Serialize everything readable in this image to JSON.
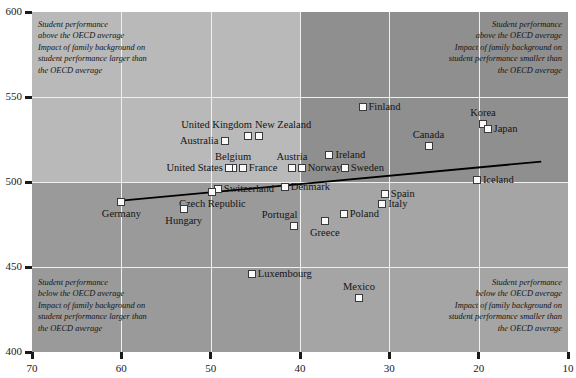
{
  "chart_data": {
    "type": "scatter",
    "title": "",
    "xlabel": "",
    "ylabel": "",
    "xlim": [
      70,
      10
    ],
    "ylim": [
      400,
      600
    ],
    "x_axis_reversed": true,
    "x_ticks": [
      70,
      60,
      50,
      40,
      30,
      20,
      10
    ],
    "y_ticks": [
      400,
      450,
      500,
      550,
      600
    ],
    "grid": true,
    "legend": "none",
    "quadrant_split": {
      "x": 40,
      "y": 500
    },
    "trendline": {
      "x_start": 60,
      "y_start": 489,
      "x_end": 13,
      "y_end": 512
    },
    "points": [
      {
        "label": "Finland",
        "x": 33.0,
        "y": 544,
        "label_pos": "right"
      },
      {
        "label": "Canada",
        "x": 25.6,
        "y": 521,
        "label_pos": "above"
      },
      {
        "label": "Ireland",
        "x": 36.7,
        "y": 516,
        "label_pos": "right"
      },
      {
        "label": "Korea",
        "x": 19.5,
        "y": 534,
        "label_pos": "above"
      },
      {
        "label": "Japan",
        "x": 19.0,
        "y": 531,
        "label_pos": "right"
      },
      {
        "label": "Sweden",
        "x": 35.0,
        "y": 508,
        "label_pos": "right"
      },
      {
        "label": "United Kingdom",
        "x": 45.8,
        "y": 527,
        "label_pos": "above-left"
      },
      {
        "label": "New Zealand",
        "x": 44.6,
        "y": 527,
        "label_pos": "above-right"
      },
      {
        "label": "Australia",
        "x": 48.4,
        "y": 524,
        "label_pos": "left"
      },
      {
        "label": "Belgium",
        "x": 47.5,
        "y": 508,
        "label_pos": "above"
      },
      {
        "label": "France",
        "x": 46.4,
        "y": 508,
        "label_pos": "right"
      },
      {
        "label": "United States",
        "x": 48.0,
        "y": 508,
        "label_pos": "left"
      },
      {
        "label": "Austria",
        "x": 40.9,
        "y": 508,
        "label_pos": "above"
      },
      {
        "label": "Norway",
        "x": 39.8,
        "y": 508,
        "label_pos": "right"
      },
      {
        "label": "Iceland",
        "x": 20.2,
        "y": 501,
        "label_pos": "right"
      },
      {
        "label": "Denmark",
        "x": 41.7,
        "y": 497,
        "label_pos": "right"
      },
      {
        "label": "Switzerland",
        "x": 49.2,
        "y": 496,
        "label_pos": "right"
      },
      {
        "label": "Czech Republic",
        "x": 49.8,
        "y": 494,
        "label_pos": "below"
      },
      {
        "label": "Germany",
        "x": 60.0,
        "y": 488,
        "label_pos": "below"
      },
      {
        "label": "Hungary",
        "x": 53.0,
        "y": 484,
        "label_pos": "below"
      },
      {
        "label": "Spain",
        "x": 30.5,
        "y": 493,
        "label_pos": "right"
      },
      {
        "label": "Italy",
        "x": 30.8,
        "y": 487,
        "label_pos": "right"
      },
      {
        "label": "Poland",
        "x": 35.1,
        "y": 481,
        "label_pos": "right"
      },
      {
        "label": "Greece",
        "x": 37.2,
        "y": 477,
        "label_pos": "below"
      },
      {
        "label": "Portugal",
        "x": 40.7,
        "y": 474,
        "label_pos": "above-left"
      },
      {
        "label": "Luxembourg",
        "x": 45.4,
        "y": 446,
        "label_pos": "right"
      },
      {
        "label": "Mexico",
        "x": 33.4,
        "y": 432,
        "label_pos": "above"
      }
    ],
    "annotations": [
      {
        "id": "top-left",
        "text": "Student performance\nabove the OECD average\nImpact of family background on\nstudent performance larger than\nthe OECD average",
        "align": "left"
      },
      {
        "id": "top-right",
        "text": "Student performance\nabove the OECD average\nImpact of family background on\nstudent performance smaller than\nthe OECD average",
        "align": "right"
      },
      {
        "id": "bottom-left",
        "text": "Student performance\nbelow the OECD average\nImpact of family background on\nstudent performance larger than\nthe OECD average",
        "align": "left"
      },
      {
        "id": "bottom-right",
        "text": "Student performance\nbelow the OECD average\nImpact of family background on\nstudent performance smaller than\nthe OECD average",
        "align": "right"
      }
    ],
    "colors": {
      "quad_top_left": "#b9b9b9",
      "quad_top_right": "#8f8f8f",
      "quad_bottom_left": "#9a9a9a",
      "quad_bottom_right": "#a5a5a5",
      "gridline": "#f0f0f0",
      "marker_fill": "#fafafa",
      "marker_stroke": "#3a3a3a",
      "trendline": "#000000",
      "axis": "#1a1a1a",
      "text": "#141414"
    }
  }
}
